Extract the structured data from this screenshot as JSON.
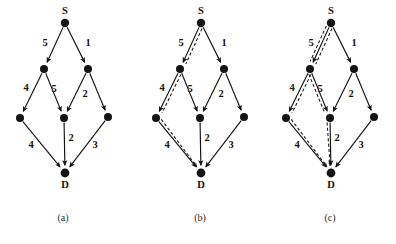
{
  "figure": {
    "background_color": "#ffffff",
    "ink_color": "#141414",
    "width": 396,
    "height": 244
  },
  "nodes": {
    "source_label": "S",
    "sink_label": "D",
    "layout": [
      {
        "id": "S",
        "x": 65,
        "y": 23,
        "r": 4.2
      },
      {
        "id": "UL",
        "x": 44,
        "y": 69,
        "r": 4.0
      },
      {
        "id": "UR",
        "x": 88,
        "y": 69,
        "r": 4.0
      },
      {
        "id": "L",
        "x": 20,
        "y": 118,
        "r": 4.0
      },
      {
        "id": "M",
        "x": 64,
        "y": 118,
        "r": 4.0
      },
      {
        "id": "R",
        "x": 108,
        "y": 117,
        "r": 4.0
      },
      {
        "id": "D",
        "x": 65,
        "y": 173,
        "r": 4.4
      }
    ]
  },
  "edges": [
    {
      "from": "S",
      "to": "UL",
      "weight": "5",
      "label_x": 45,
      "label_y": 44
    },
    {
      "from": "S",
      "to": "UR",
      "weight": "1",
      "label_x": 88,
      "label_y": 44
    },
    {
      "from": "UL",
      "to": "L",
      "weight": "4",
      "label_x": 26,
      "label_y": 89
    },
    {
      "from": "UL",
      "to": "M",
      "weight": "5",
      "label_x": 54,
      "label_y": 90
    },
    {
      "from": "UR",
      "to": "M",
      "weight": "2",
      "label_x": 85,
      "label_y": 95
    },
    {
      "from": "UR",
      "to": "R",
      "weight": "",
      "label_x": 0,
      "label_y": 0
    },
    {
      "from": "L",
      "to": "D",
      "weight": "4",
      "label_x": 31,
      "label_y": 146
    },
    {
      "from": "M",
      "to": "D",
      "weight": "2",
      "label_x": 71,
      "label_y": 139
    },
    {
      "from": "R",
      "to": "D",
      "weight": "3",
      "label_x": 95,
      "label_y": 146
    }
  ],
  "panels": [
    {
      "id": "a",
      "caption": "(a)",
      "caption_x": 63,
      "caption_y": 219,
      "offset_x": 0,
      "highlighted_paths": []
    },
    {
      "id": "b",
      "caption": "(b)",
      "caption_x": 200,
      "caption_y": 219,
      "offset_x": 136,
      "highlighted_paths": [
        {
          "name": "path-s-ul-l-d",
          "nodes": [
            "S",
            "UL",
            "L",
            "D"
          ],
          "style": "dashed",
          "total_cost": 13
        }
      ]
    },
    {
      "id": "c",
      "caption": "(c)",
      "caption_x": 330,
      "caption_y": 219,
      "offset_x": 266,
      "highlighted_paths": [
        {
          "name": "path-s-ul-l-d",
          "nodes": [
            "S",
            "UL",
            "L",
            "D"
          ],
          "style": "dashed",
          "total_cost": 13
        },
        {
          "name": "path-s-ul-m-d",
          "nodes": [
            "S",
            "UL",
            "M",
            "D"
          ],
          "style": "dashed",
          "total_cost": 12
        }
      ]
    }
  ]
}
